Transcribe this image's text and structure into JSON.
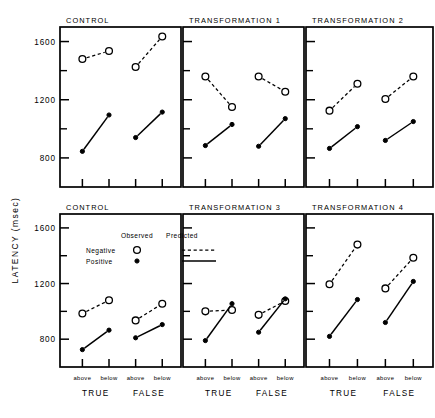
{
  "figure": {
    "y_axis_title": "LATENCY (msec)",
    "y_ticks_major": [
      "1600",
      "1200",
      "800"
    ],
    "x_sub_labels": [
      "above",
      "below",
      "above",
      "below"
    ],
    "x_group_labels": [
      "TRUE",
      "FALSE"
    ],
    "legend": {
      "col_observed": "Observed",
      "col_predicted": "Predicted",
      "row_negative": "Negative",
      "row_positive": "Positive",
      "observed_negative_symbol": "open-circle",
      "observed_positive_symbol": "filled-circle",
      "predicted_negative_symbol": "dashed-line",
      "predicted_positive_symbol": "solid-line"
    },
    "colors": {
      "ink": "#000000",
      "background": "#ffffff"
    }
  },
  "chart_data": {
    "type": "line",
    "title": "",
    "xlabel": "",
    "ylabel": "LATENCY (msec)",
    "ylim": [
      600,
      1700
    ],
    "y_ticks_major": [
      800,
      1200,
      1600
    ],
    "y_ticks_minor": [
      1000,
      1400
    ],
    "grid": false,
    "legend_position": "inset-bottom-left-panel",
    "categories": [
      "TRUE above",
      "TRUE below",
      "FALSE above",
      "FALSE below"
    ],
    "series_names": [
      "Negative",
      "Positive"
    ],
    "panels": [
      {
        "title": "CONTROL",
        "row": 0,
        "col": 0,
        "series": [
          {
            "name": "Negative",
            "style": "dashed",
            "marker": "open-circle",
            "values": [
              1480,
              1535,
              1425,
              1635
            ]
          },
          {
            "name": "Positive",
            "style": "solid",
            "marker": "filled-circle",
            "values": [
              845,
              1095,
              940,
              1115
            ]
          }
        ]
      },
      {
        "title": "TRANSFORMATION 1",
        "row": 0,
        "col": 1,
        "series": [
          {
            "name": "Negative",
            "style": "dashed",
            "marker": "open-circle",
            "values": [
              1360,
              1150,
              1360,
              1255
            ]
          },
          {
            "name": "Positive",
            "style": "solid",
            "marker": "filled-circle",
            "values": [
              885,
              1030,
              880,
              1070
            ]
          }
        ]
      },
      {
        "title": "TRANSFORMATION 2",
        "row": 0,
        "col": 2,
        "series": [
          {
            "name": "Negative",
            "style": "dashed",
            "marker": "open-circle",
            "values": [
              1125,
              1310,
              1205,
              1360
            ]
          },
          {
            "name": "Positive",
            "style": "solid",
            "marker": "filled-circle",
            "values": [
              865,
              1015,
              920,
              1050
            ]
          }
        ]
      },
      {
        "title": "CONTROL",
        "row": 1,
        "col": 0,
        "series": [
          {
            "name": "Negative",
            "style": "dashed",
            "marker": "open-circle",
            "values": [
              985,
              1080,
              935,
              1055
            ]
          },
          {
            "name": "Positive",
            "style": "solid",
            "marker": "filled-circle",
            "values": [
              725,
              865,
              810,
              905
            ]
          }
        ]
      },
      {
        "title": "TRANSFORMATION 3",
        "row": 1,
        "col": 1,
        "series": [
          {
            "name": "Negative",
            "style": "dashed",
            "marker": "open-circle",
            "values": [
              1000,
              1010,
              975,
              1075
            ]
          },
          {
            "name": "Positive",
            "style": "solid",
            "marker": "filled-circle",
            "values": [
              790,
              1055,
              850,
              1090
            ]
          }
        ]
      },
      {
        "title": "TRANSFORMATION 4",
        "row": 1,
        "col": 2,
        "series": [
          {
            "name": "Negative",
            "style": "dashed",
            "marker": "open-circle",
            "values": [
              1195,
              1480,
              1165,
              1385
            ]
          },
          {
            "name": "Positive",
            "style": "solid",
            "marker": "filled-circle",
            "values": [
              820,
              1085,
              920,
              1215
            ]
          }
        ]
      }
    ]
  }
}
